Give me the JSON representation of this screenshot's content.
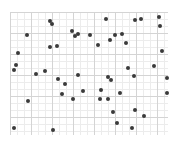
{
  "chart_data": {
    "type": "scatter",
    "title": "",
    "xlabel": "",
    "ylabel": "",
    "grid": true,
    "legend": null,
    "xlim": [
      0,
      158
    ],
    "ylim": [
      0,
      123
    ],
    "point_color": "#3a3a3a",
    "points": [
      {
        "x": 40,
        "y": 114
      },
      {
        "x": 42,
        "y": 111
      },
      {
        "x": 17,
        "y": 100
      },
      {
        "x": 40,
        "y": 88
      },
      {
        "x": 47,
        "y": 89
      },
      {
        "x": 62,
        "y": 104
      },
      {
        "x": 65,
        "y": 99
      },
      {
        "x": 68,
        "y": 101
      },
      {
        "x": 80,
        "y": 100
      },
      {
        "x": 96,
        "y": 116
      },
      {
        "x": 88,
        "y": 90
      },
      {
        "x": 100,
        "y": 95
      },
      {
        "x": 105,
        "y": 100
      },
      {
        "x": 125,
        "y": 115
      },
      {
        "x": 131,
        "y": 116
      },
      {
        "x": 149,
        "y": 118
      },
      {
        "x": 150,
        "y": 109
      },
      {
        "x": 112,
        "y": 101
      },
      {
        "x": 116,
        "y": 92
      },
      {
        "x": 8,
        "y": 82
      },
      {
        "x": 6,
        "y": 70
      },
      {
        "x": 4,
        "y": 65
      },
      {
        "x": 26,
        "y": 61
      },
      {
        "x": 35,
        "y": 64
      },
      {
        "x": 48,
        "y": 56
      },
      {
        "x": 68,
        "y": 60
      },
      {
        "x": 55,
        "y": 51
      },
      {
        "x": 52,
        "y": 41
      },
      {
        "x": 73,
        "y": 44
      },
      {
        "x": 98,
        "y": 58
      },
      {
        "x": 101,
        "y": 55
      },
      {
        "x": 91,
        "y": 45
      },
      {
        "x": 152,
        "y": 84
      },
      {
        "x": 118,
        "y": 67
      },
      {
        "x": 144,
        "y": 69
      },
      {
        "x": 124,
        "y": 59
      },
      {
        "x": 110,
        "y": 42
      },
      {
        "x": 18,
        "y": 34
      },
      {
        "x": 63,
        "y": 36
      },
      {
        "x": 90,
        "y": 36
      },
      {
        "x": 98,
        "y": 36
      },
      {
        "x": 103,
        "y": 23
      },
      {
        "x": 125,
        "y": 25
      },
      {
        "x": 134,
        "y": 19
      },
      {
        "x": 107,
        "y": 12
      },
      {
        "x": 122,
        "y": 7
      },
      {
        "x": 157,
        "y": 57
      },
      {
        "x": 157,
        "y": 42
      },
      {
        "x": 4,
        "y": 7
      },
      {
        "x": 43,
        "y": 5
      }
    ]
  }
}
